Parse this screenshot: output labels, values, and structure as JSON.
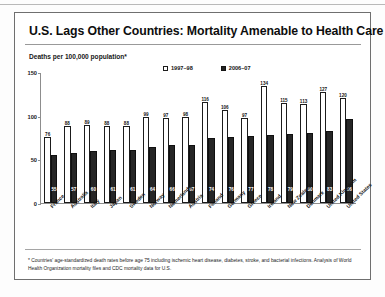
{
  "slide": {
    "title": "U.S. Lags Other Countries: Mortality Amenable to Health Care",
    "axis_caption": "Deaths per 100,000 population*",
    "footnote": "* Countries' age-standardized death rates before age 75 including ischemic heart disease, diabetes, stroke, and bacterial infections. Analysis of World Health Organization mortality files and CDC mortality data for U.S."
  },
  "chart_data": {
    "type": "bar",
    "title": "U.S. Lags Other Countries: Mortality Amenable to Health Care",
    "xlabel": "",
    "ylabel": "Deaths per 100,000 population*",
    "ylim": [
      0,
      150
    ],
    "yticks": [
      0,
      50,
      100,
      150
    ],
    "grid": false,
    "legend_position": "top-center",
    "categories": [
      "France",
      "Australia",
      "Italy",
      "Japan",
      "Sweden",
      "Norway",
      "Netherlands",
      "Austria",
      "Finland",
      "Germany",
      "Greece",
      "Ireland",
      "New Zealand",
      "Denmark",
      "United Kingdom",
      "United States"
    ],
    "series": [
      {
        "name": "1997-98",
        "color": "#ffffff",
        "values": [
          76,
          88,
          89,
          88,
          88,
          99,
          97,
          98,
          116,
          106,
          97,
          134,
          115,
          113,
          127,
          120
        ]
      },
      {
        "name": "2006-07",
        "color": "#262626",
        "values": [
          55,
          57,
          60,
          61,
          61,
          64,
          66,
          67,
          74,
          76,
          77,
          78,
          79,
          80,
          83,
          96
        ]
      }
    ]
  },
  "legend": {
    "items": [
      {
        "label": "1997–98",
        "swatch": "light"
      },
      {
        "label": "2006–07",
        "swatch": "dark"
      }
    ]
  }
}
